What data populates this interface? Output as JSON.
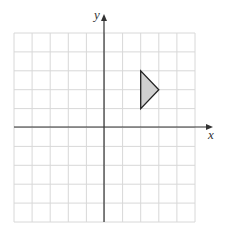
{
  "diagram": {
    "type": "coordinate-grid",
    "axes": {
      "x_label": "x",
      "y_label": "y",
      "x_range": [
        -5,
        5
      ],
      "y_range": [
        -5,
        5
      ],
      "grid_step": 1
    },
    "shape": {
      "type": "triangle",
      "vertices": [
        [
          2,
          3
        ],
        [
          2,
          1
        ],
        [
          3,
          2
        ]
      ],
      "fill": "#d0d0d0",
      "stroke": "#222222"
    },
    "colors": {
      "grid": "#d8d8d8",
      "axis": "#333333"
    }
  }
}
